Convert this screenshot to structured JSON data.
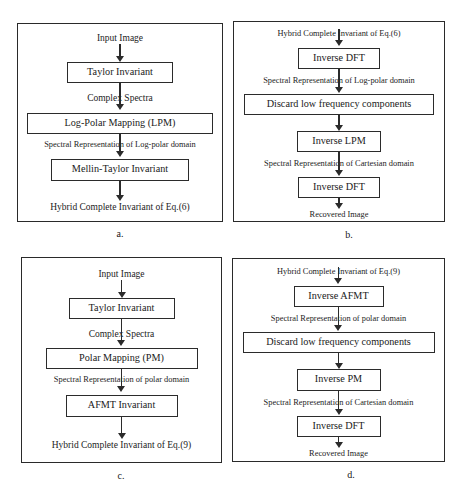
{
  "figure": {
    "background_color": "#ffffff",
    "line_color": "#2b2b2b",
    "text_color": "#1a1a1a"
  },
  "panels": [
    {
      "caption": "a.",
      "steps": {
        "start_label": "Input  Image",
        "node_1": "Taylor Invariant",
        "label_1": "Complex  Spectra",
        "node_2": "Log-Polar Mapping (LPM)",
        "label_2": "Spectral Representation of Log-polar domain",
        "node_3": "Mellin-Taylor Invariant",
        "end_label": "Hybrid Complete Invariant of Eq.(6)"
      }
    },
    {
      "caption": "b.",
      "steps": {
        "start_label": "Hybrid Complete Invariant of Eq.(6)",
        "node_1": "Inverse DFT",
        "label_1": "Spectral Representation of Log-polar domain",
        "node_2": "Discard low frequency components",
        "node_3": "Inverse LPM",
        "label_2": "Spectral Representation of Cartesian domain",
        "node_4": "Inverse DFT",
        "end_label": "Recovered Image"
      }
    },
    {
      "caption": "c.",
      "steps": {
        "start_label": "Input Image",
        "node_1": "Taylor Invariant",
        "label_1": "Complex  Spectra",
        "node_2": "Polar Mapping (PM)",
        "label_2": "Spectral Representation of polar domain",
        "node_3": "AFMT Invariant",
        "end_label": "Hybrid Complete Invariant of Eq.(9)"
      }
    },
    {
      "caption": "d.",
      "steps": {
        "start_label": "Hybrid Complete Invariant of Eq.(9)",
        "node_1": "Inverse AFMT",
        "label_1": "Spectral Representation of polar domain",
        "node_2": "Discard low frequency components",
        "node_3": "Inverse PM",
        "label_2": "Spectral Representation of Cartesian domain",
        "node_4": "Inverse DFT",
        "end_label": "Recovered Image"
      }
    }
  ]
}
